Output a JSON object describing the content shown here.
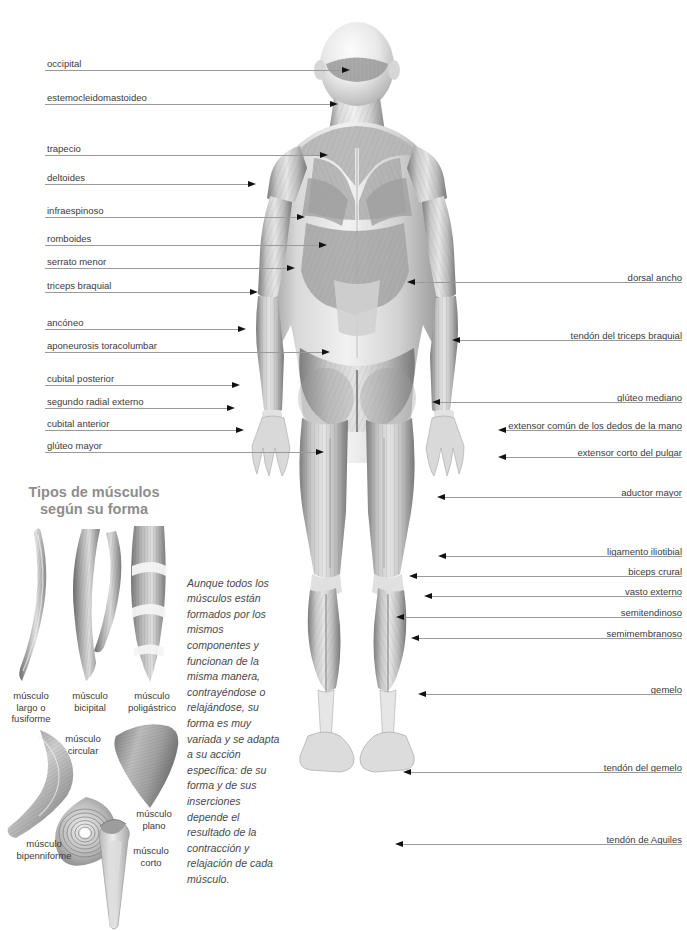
{
  "page": {
    "language": "es",
    "bg_color": "#ffffff",
    "label_color": "#3a3a3a",
    "heading_color": "#8d8d8d"
  },
  "labels_left": [
    {
      "text": "occipital",
      "y": 58,
      "lead_y": 70,
      "tip_x": 350
    },
    {
      "text": "estemocleidomastoideo",
      "y": 92,
      "lead_y": 104,
      "tip_x": 338
    },
    {
      "text": "trapecio",
      "y": 143,
      "lead_y": 155,
      "tip_x": 328
    },
    {
      "text": "deltoides",
      "y": 172,
      "lead_y": 184,
      "tip_x": 256
    },
    {
      "text": "infraespinoso",
      "y": 205,
      "lead_y": 217,
      "tip_x": 305
    },
    {
      "text": "romboides",
      "y": 233,
      "lead_y": 245,
      "tip_x": 327
    },
    {
      "text": "serrato menor",
      "y": 256,
      "lead_y": 268,
      "tip_x": 295
    },
    {
      "text": "triceps braquial",
      "y": 280,
      "lead_y": 292,
      "tip_x": 258
    },
    {
      "text": "ancóneo",
      "y": 317,
      "lead_y": 329,
      "tip_x": 246
    },
    {
      "text": "aponeurosis toracolumbar",
      "y": 340,
      "lead_y": 352,
      "tip_x": 330
    },
    {
      "text": "cubital posterior",
      "y": 373,
      "lead_y": 385,
      "tip_x": 240
    },
    {
      "text": "segundo radial externo",
      "y": 396,
      "lead_y": 408,
      "tip_x": 235
    },
    {
      "text": "cubital anterior",
      "y": 418,
      "lead_y": 430,
      "tip_x": 244
    },
    {
      "text": "glúteo mayor",
      "y": 440,
      "lead_y": 452,
      "tip_x": 324
    }
  ],
  "labels_right": [
    {
      "text": "dorsal ancho",
      "y": 272,
      "lead_y": 282,
      "tip_x": 407
    },
    {
      "text": "tendón del triceps braquial",
      "y": 330,
      "lead_y": 340,
      "tip_x": 452
    },
    {
      "text": "glúteo mediano",
      "y": 392,
      "lead_y": 402,
      "tip_x": 432
    },
    {
      "text": "extensor común de los dedos de la mano",
      "y": 420,
      "lead_y": 430,
      "tip_x": 498
    },
    {
      "text": "extensor corto del pulgar",
      "y": 447,
      "lead_y": 457,
      "tip_x": 498
    },
    {
      "text": "aductor mayor",
      "y": 487,
      "lead_y": 497,
      "tip_x": 437
    },
    {
      "text": "ligamento iliotibial",
      "y": 546,
      "lead_y": 556,
      "tip_x": 438
    },
    {
      "text": "biceps crural",
      "y": 566,
      "lead_y": 576,
      "tip_x": 409
    },
    {
      "text": "vasto externo",
      "y": 586,
      "lead_y": 596,
      "tip_x": 424
    },
    {
      "text": "semitendinoso",
      "y": 607,
      "lead_y": 617,
      "tip_x": 396
    },
    {
      "text": "semimembranoso",
      "y": 628,
      "lead_y": 638,
      "tip_x": 411
    },
    {
      "text": "gemelo",
      "y": 684,
      "lead_y": 694,
      "tip_x": 418
    },
    {
      "text": "tendón del gemelo",
      "y": 762,
      "lead_y": 772,
      "tip_x": 403
    },
    {
      "text": "tendón de Aquiles",
      "y": 834,
      "lead_y": 844,
      "tip_x": 395
    }
  ],
  "muscle_types": {
    "heading_line1": "Tipos de músculos",
    "heading_line2": "según su forma",
    "items": [
      {
        "id": "fusiforme",
        "caption": "músculo\nlargo o\nfusiforme",
        "x": 2,
        "y": 690,
        "w": 58
      },
      {
        "id": "bicipital",
        "caption": "músculo\nbicipital",
        "x": 60,
        "y": 690,
        "w": 60
      },
      {
        "id": "poligastrico",
        "caption": "músculo\npoligástrico",
        "x": 118,
        "y": 690,
        "w": 68
      },
      {
        "id": "bipenniforme",
        "caption": "músculo\nbipenniforme",
        "x": 5,
        "y": 838,
        "w": 78
      },
      {
        "id": "circular",
        "caption": "músculo\ncircular",
        "x": 52,
        "y": 733,
        "w": 62
      },
      {
        "id": "plano",
        "caption": "músculo\nplano",
        "x": 128,
        "y": 808,
        "w": 52
      },
      {
        "id": "corto",
        "caption": "músculo\ncorto",
        "x": 125,
        "y": 845,
        "w": 52
      }
    ]
  },
  "paragraph": {
    "text": "Aunque todos los músculos están formados por los mismos componentes y funcionan de la misma manera, contrayéndose o relajándose, su forma es muy variada y se adapta a su acción específica: de su forma y de sus inserciones depende el resultado de la contracción y relajación de cada músculo."
  }
}
